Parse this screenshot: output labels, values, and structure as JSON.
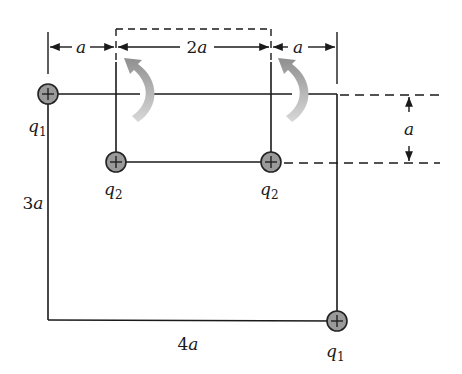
{
  "diagram": {
    "type": "physics-charge-configuration",
    "colors": {
      "line": "#1a1a1a",
      "charge_fill": "#9a9a9a",
      "charge_stroke": "#222222",
      "arrow_fill": "#a8a8a8"
    },
    "charges": [
      {
        "id": "q1-top-left",
        "name": "q",
        "sub": "1",
        "sign": "+"
      },
      {
        "id": "q2-left",
        "name": "q",
        "sub": "2",
        "sign": "+"
      },
      {
        "id": "q2-right",
        "name": "q",
        "sub": "2",
        "sign": "+"
      },
      {
        "id": "q1-bottom-right",
        "name": "q",
        "sub": "1",
        "sign": "+"
      }
    ],
    "dimensions": {
      "top_left": "a",
      "top_middle_coef": "2",
      "top_middle_var": "a",
      "top_right": "a",
      "right_vertical": "a",
      "left_side_coef": "3",
      "left_side_var": "a",
      "bottom_coef": "4",
      "bottom_var": "a"
    },
    "rotation_arrows": 2
  }
}
